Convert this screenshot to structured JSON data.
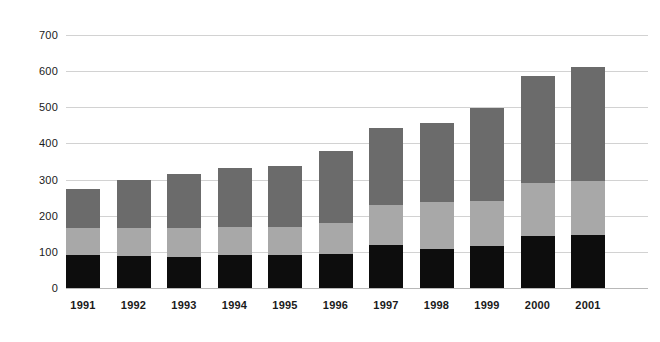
{
  "chart_data": {
    "type": "bar",
    "title": "",
    "subtitle": "",
    "xlabel": "",
    "ylabel": "",
    "stacked": true,
    "grid": true,
    "legend_position": "none",
    "ylim": [
      0,
      700
    ],
    "yticks": [
      0,
      100,
      200,
      300,
      400,
      500,
      600,
      700
    ],
    "ytick_labels": [
      "0",
      "100",
      "200",
      "300",
      "400",
      "500",
      "600",
      "700"
    ],
    "categories": [
      "1991",
      "1992",
      "1993",
      "1994",
      "1995",
      "1996",
      "1997",
      "1998",
      "1999",
      "2000",
      "2001"
    ],
    "series": [
      {
        "name": "bottom-segment",
        "color": "#0d0d0d",
        "values": [
          92,
          88,
          87,
          90,
          90,
          95,
          120,
          108,
          115,
          144,
          148
        ]
      },
      {
        "name": "middle-segment",
        "color": "#a8a8a8",
        "values": [
          74,
          77,
          78,
          78,
          80,
          85,
          110,
          130,
          125,
          146,
          147
        ]
      },
      {
        "name": "top-segment",
        "color": "#6b6b6b",
        "values": [
          109,
          134,
          150,
          163,
          167,
          198,
          212,
          218,
          258,
          297,
          317
        ]
      }
    ],
    "totals": [
      275,
      299,
      315,
      331,
      337,
      378,
      442,
      456,
      498,
      587,
      612
    ]
  },
  "axis": {
    "y_tick_labels": [
      "700",
      "600",
      "500",
      "400",
      "300",
      "200",
      "100",
      "0"
    ],
    "x_tick_labels": [
      "1991",
      "1992",
      "1993",
      "1994",
      "1995",
      "1996",
      "1997",
      "1998",
      "1999",
      "2000",
      "2001"
    ]
  },
  "colors": {
    "bottom": "#0d0d0d",
    "middle": "#a8a8a8",
    "top": "#6b6b6b",
    "gridline": "#d2d2d2",
    "baseline": "#b8b8b8",
    "text": "#1a1a1a",
    "background": "#ffffff"
  }
}
